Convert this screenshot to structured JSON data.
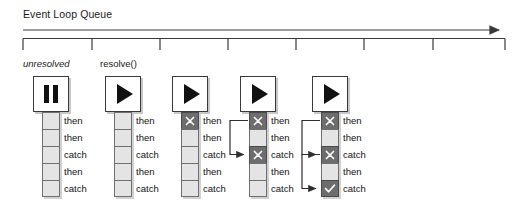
{
  "diagram": {
    "title": "Event Loop Queue",
    "timeline": {
      "arrow_label": "time-arrow",
      "tick_count": 8,
      "ticks": [
        23,
        92,
        160,
        228,
        296,
        364,
        433,
        505
      ],
      "axis_start_x": 23,
      "axis_end_x": 507
    },
    "phase_labels": [
      {
        "name": "unresolved",
        "text": "unresolved",
        "x": 23,
        "italic": true
      },
      {
        "name": "resolve",
        "text": "resolve()",
        "x": 100,
        "italic": false
      }
    ],
    "queue_labels": [
      "then",
      "then",
      "catch",
      "then",
      "catch"
    ],
    "colors": {
      "cell_pending": "#e4e4e4",
      "cell_marked": "#6d6d6d",
      "cell_border": "#6f6f6f",
      "box_border": "#3a3a3a",
      "icon": "#111111",
      "axis": "#3a3a3a",
      "text": "#111111"
    },
    "columns": [
      {
        "name": "column-unresolved",
        "x": 33,
        "state_icon": "pause-icon",
        "state": "unresolved",
        "cells": [
          {
            "label": "then",
            "marker": "none"
          },
          {
            "label": "then",
            "marker": "none"
          },
          {
            "label": "catch",
            "marker": "none"
          },
          {
            "label": "then",
            "marker": "none"
          },
          {
            "label": "catch",
            "marker": "none"
          }
        ],
        "connectors": []
      },
      {
        "name": "column-resolved",
        "x": 105,
        "state_icon": "play-icon",
        "state": "resolved",
        "cells": [
          {
            "label": "then",
            "marker": "none"
          },
          {
            "label": "then",
            "marker": "none"
          },
          {
            "label": "catch",
            "marker": "none"
          },
          {
            "label": "then",
            "marker": "none"
          },
          {
            "label": "catch",
            "marker": "none"
          }
        ],
        "connectors": []
      },
      {
        "name": "column-first-then-rejected",
        "x": 172,
        "state_icon": "play-icon",
        "state": "resolved",
        "cells": [
          {
            "label": "then",
            "marker": "x"
          },
          {
            "label": "then",
            "marker": "none"
          },
          {
            "label": "catch",
            "marker": "none"
          },
          {
            "label": "then",
            "marker": "none"
          },
          {
            "label": "catch",
            "marker": "none"
          }
        ],
        "connectors": []
      },
      {
        "name": "column-catch-reached",
        "x": 240,
        "state_icon": "play-icon",
        "state": "resolved",
        "cells": [
          {
            "label": "then",
            "marker": "x"
          },
          {
            "label": "then",
            "marker": "none"
          },
          {
            "label": "catch",
            "marker": "x"
          },
          {
            "label": "then",
            "marker": "none"
          },
          {
            "label": "catch",
            "marker": "none"
          }
        ],
        "connectors": [
          {
            "from": 0,
            "to": 2
          }
        ]
      },
      {
        "name": "column-final-catch-handled",
        "x": 312,
        "state_icon": "play-icon",
        "state": "resolved",
        "cells": [
          {
            "label": "then",
            "marker": "x"
          },
          {
            "label": "then",
            "marker": "none"
          },
          {
            "label": "catch",
            "marker": "x"
          },
          {
            "label": "then",
            "marker": "none"
          },
          {
            "label": "catch",
            "marker": "check"
          }
        ],
        "connectors": [
          {
            "from": 0,
            "to": 2
          },
          {
            "from": 2,
            "to": 4
          }
        ]
      }
    ]
  }
}
